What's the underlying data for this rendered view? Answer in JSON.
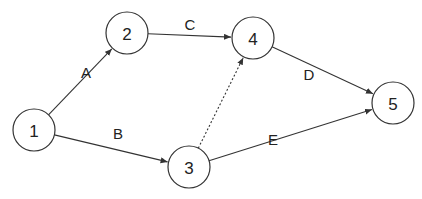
{
  "diagram": {
    "type": "network-activity-on-arrow",
    "nodes": [
      {
        "id": "1",
        "label": "1",
        "cx": 34,
        "cy": 130,
        "r": 21
      },
      {
        "id": "2",
        "label": "2",
        "cx": 127,
        "cy": 33,
        "r": 21
      },
      {
        "id": "3",
        "label": "3",
        "cx": 189,
        "cy": 167,
        "r": 21
      },
      {
        "id": "4",
        "label": "4",
        "cx": 253,
        "cy": 38,
        "r": 21
      },
      {
        "id": "5",
        "label": "5",
        "cx": 393,
        "cy": 103,
        "r": 21
      }
    ],
    "edges": [
      {
        "id": "A",
        "label": "A",
        "from": "1",
        "to": "2",
        "style": "solid",
        "lx": 86,
        "ly": 72
      },
      {
        "id": "B",
        "label": "B",
        "from": "1",
        "to": "3",
        "style": "solid",
        "lx": 118,
        "ly": 133
      },
      {
        "id": "C",
        "label": "C",
        "from": "2",
        "to": "4",
        "style": "solid",
        "lx": 190,
        "ly": 24
      },
      {
        "id": "dummy",
        "label": "",
        "from": "3",
        "to": "4",
        "style": "dotted",
        "lx": 0,
        "ly": 0
      },
      {
        "id": "D",
        "label": "D",
        "from": "4",
        "to": "5",
        "style": "solid",
        "lx": 309,
        "ly": 74
      },
      {
        "id": "E",
        "label": "E",
        "from": "3",
        "to": "5",
        "style": "solid",
        "lx": 273,
        "ly": 139
      }
    ]
  },
  "colors": {
    "stroke": "#333333",
    "text": "#222222",
    "background": "#ffffff"
  }
}
